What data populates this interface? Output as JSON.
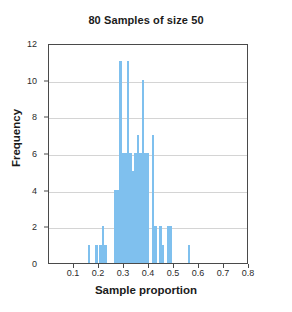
{
  "chart_data": {
    "type": "bar",
    "title": "80 Samples of size 50",
    "xlabel": "Sample proportion",
    "ylabel": "Frequency",
    "xlim": [
      0.0,
      0.8
    ],
    "ylim": [
      0,
      12
    ],
    "bin_width": 0.01,
    "grid": true,
    "legend": null,
    "bar_color": "#7fc0ee",
    "xticks": [
      0.1,
      0.2,
      0.3,
      0.4,
      0.5,
      0.6,
      0.7,
      0.8
    ],
    "xtick_labels": [
      "0.1",
      "0.2",
      "0.3",
      "0.4",
      "0.5",
      "0.6",
      "0.7",
      "0.8"
    ],
    "yticks": [
      0,
      2,
      4,
      6,
      8,
      10,
      12
    ],
    "ytick_labels": [
      "0",
      "2",
      "4",
      "6",
      "8",
      "10",
      "12"
    ],
    "gridline_values": [
      2,
      4,
      6,
      8,
      10
    ],
    "x": [
      0.16,
      0.18,
      0.19,
      0.2,
      0.21,
      0.22,
      0.23,
      0.24,
      0.26,
      0.27,
      0.28,
      0.29,
      0.3,
      0.31,
      0.32,
      0.33,
      0.34,
      0.35,
      0.36,
      0.37,
      0.38,
      0.39,
      0.4,
      0.41,
      0.42,
      0.43,
      0.44,
      0.46,
      0.47,
      0.48,
      0.49,
      0.5,
      0.56
    ],
    "values": [
      1,
      0,
      1,
      1,
      2,
      2,
      1,
      0,
      4,
      4,
      11,
      6,
      6,
      11,
      6,
      5,
      6,
      7,
      6,
      10,
      6,
      6,
      7,
      2,
      2,
      0,
      1,
      2,
      2,
      2,
      0,
      0,
      1
    ],
    "bars": [
      {
        "x": 0.16,
        "y": 1
      },
      {
        "x": 0.19,
        "y": 1
      },
      {
        "x": 0.205,
        "y": 1
      },
      {
        "x": 0.215,
        "y": 2
      },
      {
        "x": 0.225,
        "y": 1
      },
      {
        "x": 0.265,
        "y": 4
      },
      {
        "x": 0.275,
        "y": 4
      },
      {
        "x": 0.285,
        "y": 11
      },
      {
        "x": 0.295,
        "y": 6
      },
      {
        "x": 0.305,
        "y": 6
      },
      {
        "x": 0.315,
        "y": 11
      },
      {
        "x": 0.325,
        "y": 6
      },
      {
        "x": 0.335,
        "y": 5
      },
      {
        "x": 0.345,
        "y": 6
      },
      {
        "x": 0.355,
        "y": 7
      },
      {
        "x": 0.365,
        "y": 6
      },
      {
        "x": 0.375,
        "y": 10
      },
      {
        "x": 0.385,
        "y": 6
      },
      {
        "x": 0.395,
        "y": 6
      },
      {
        "x": 0.415,
        "y": 7
      },
      {
        "x": 0.425,
        "y": 2
      },
      {
        "x": 0.445,
        "y": 2
      },
      {
        "x": 0.455,
        "y": 1
      },
      {
        "x": 0.475,
        "y": 2
      },
      {
        "x": 0.485,
        "y": 2
      },
      {
        "x": 0.56,
        "y": 1
      }
    ]
  }
}
